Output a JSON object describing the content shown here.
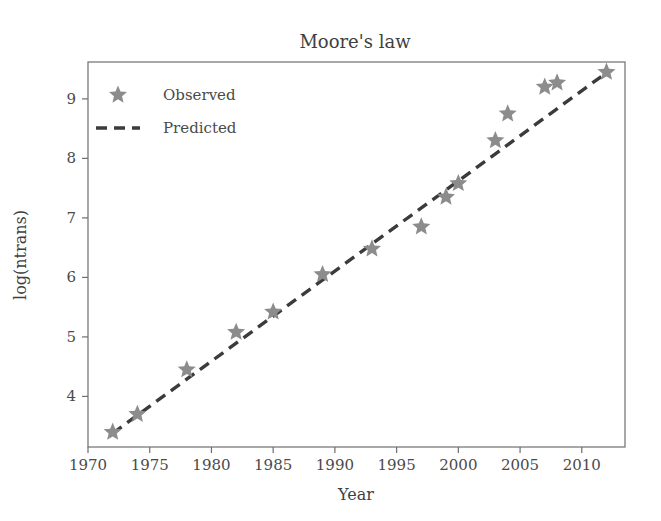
{
  "chart_data": {
    "type": "scatter",
    "title": "Moore's law",
    "xlabel": "Year",
    "ylabel": "log(ntrans)",
    "xlim": [
      1970.0,
      2013.5
    ],
    "ylim": [
      3.15,
      9.62
    ],
    "xticks": [
      1970,
      1975,
      1980,
      1985,
      1990,
      1995,
      2000,
      2005,
      2010
    ],
    "yticks": [
      4,
      5,
      6,
      7,
      8,
      9
    ],
    "grid": false,
    "legend_position": "upper left",
    "series": [
      {
        "name": "Observed",
        "type": "scatter",
        "marker": "star",
        "color": "#8c8c8c",
        "x": [
          1972,
          1974,
          1978,
          1982,
          1985,
          1989,
          1993,
          1997,
          1999,
          2000,
          2003,
          2004,
          2007,
          2008,
          2012
        ],
        "values": [
          3.4,
          3.7,
          4.45,
          5.08,
          5.42,
          6.05,
          6.48,
          6.85,
          7.35,
          7.58,
          8.3,
          8.75,
          9.2,
          9.27,
          9.45
        ]
      },
      {
        "name": "Predicted",
        "type": "line",
        "linestyle": "dashed",
        "color": "#3b3b3b",
        "x": [
          1972,
          2012
        ],
        "values": [
          3.38,
          9.44
        ]
      }
    ]
  },
  "legend": {
    "entries": [
      {
        "label": "Observed",
        "marker": "star",
        "color": "#8c8c8c"
      },
      {
        "label": "Predicted",
        "marker": "dashed-line",
        "color": "#3b3b3b"
      }
    ]
  },
  "axes": {
    "x_tick_labels": [
      "1970",
      "1975",
      "1980",
      "1985",
      "1990",
      "1995",
      "2000",
      "2005",
      "2010"
    ],
    "y_tick_labels": [
      "4",
      "5",
      "6",
      "7",
      "8",
      "9"
    ]
  },
  "colors": {
    "observed_marker": "#8c8c8c",
    "predicted_line": "#3b3b3b",
    "spine": "#6e6e6e",
    "text": "#3f3f3f",
    "background": "#ffffff"
  }
}
